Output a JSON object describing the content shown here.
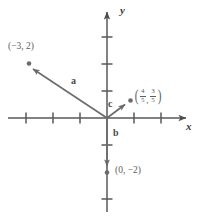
{
  "figure": {
    "type": "vector-diagram",
    "background_color": "#ffffff",
    "axis_color": "#58585a",
    "vector_color": "#6b6b6d",
    "label_color": "#5d5d5f"
  },
  "axes": {
    "x_axis_label": "x",
    "y_axis_label": "y",
    "origin_px": {
      "x": 107,
      "y": 118
    },
    "unit_px": 27,
    "x_ticks": [
      -3,
      -2,
      -1,
      1,
      2
    ],
    "y_ticks": [
      3,
      2,
      1,
      -1,
      -3
    ],
    "x_range": [
      -4,
      2.6
    ],
    "y_range": [
      -3.6,
      3.9
    ],
    "grid": false
  },
  "vectors": [
    {
      "name": "a",
      "label": "a",
      "components": [
        -3,
        2
      ],
      "tail": [
        0,
        0
      ],
      "head": [
        -3,
        2
      ],
      "endpoint_label": "(−3, 2)",
      "has_endpoint_dot": true
    },
    {
      "name": "b",
      "label": "b",
      "components": [
        0,
        -2
      ],
      "tail": [
        0,
        0
      ],
      "head": [
        0,
        -2
      ],
      "endpoint_label": "(0, −2)",
      "has_endpoint_dot": true
    },
    {
      "name": "c",
      "label": "c",
      "components": [
        0.8,
        0.6
      ],
      "tail": [
        0,
        0
      ],
      "head": [
        0.8,
        0.6
      ],
      "endpoint_label_numerator_x": "4",
      "endpoint_label_denominator_x": "5",
      "endpoint_label_numerator_y": "3",
      "endpoint_label_denominator_y": "5",
      "endpoint_label_comma": ",",
      "endpoint_label_open_paren": "(",
      "endpoint_label_close_paren": ")",
      "has_endpoint_dot": true
    }
  ]
}
